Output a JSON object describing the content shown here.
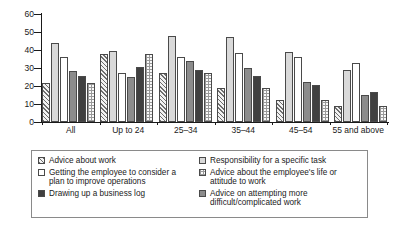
{
  "chart_data": {
    "type": "bar",
    "title": "",
    "xlabel": "",
    "ylabel": "",
    "ylim": [
      0,
      60
    ],
    "yticks": [
      0,
      10,
      20,
      30,
      40,
      50,
      60
    ],
    "grid": false,
    "legend_position": "bottom",
    "categories": [
      "All",
      "Up to 24",
      "25–34",
      "35–44",
      "45–54",
      "55 and above"
    ],
    "series": [
      {
        "name": "Advice about work",
        "pattern": "diagonal-hatch",
        "color": "#f2f2f2",
        "values": [
          21.5,
          38.0,
          27.5,
          19.0,
          12.0,
          9.0
        ]
      },
      {
        "name": "Responsibility for a specific task",
        "pattern": "light-gray-solid",
        "color": "#d9d9d9",
        "values": [
          44.0,
          39.5,
          48.0,
          47.5,
          39.0,
          29.0
        ]
      },
      {
        "name": "Getting the employee to consider a plan to improve operations",
        "pattern": "white-empty",
        "color": "#ffffff",
        "values": [
          36.0,
          27.0,
          36.0,
          38.5,
          36.0,
          33.0
        ]
      },
      {
        "name": "Advice about the employee's life or attitude to work",
        "pattern": "medium-gray-solid",
        "color": "#8c8c8c",
        "values": [
          28.5,
          25.0,
          34.0,
          30.0,
          22.0,
          15.0
        ]
      },
      {
        "name": "Drawing up a business log",
        "pattern": "dark-gray-solid",
        "color": "#404040",
        "values": [
          25.5,
          30.5,
          29.0,
          25.5,
          20.5,
          16.5
        ]
      },
      {
        "name": "Advice on attempting more difficult/complicated work",
        "pattern": "light-checker",
        "color": "#fafafa",
        "values": [
          21.5,
          38.0,
          27.5,
          19.0,
          12.0,
          9.0
        ]
      }
    ]
  },
  "legend": {
    "items": [
      {
        "label": "Advice about work",
        "swatch": "diagonal-hatch"
      },
      {
        "label": "Getting the employee to consider a plan to improve operations",
        "swatch": "white-empty"
      },
      {
        "label": "Drawing up a business log",
        "swatch": "dark-gray-solid"
      },
      {
        "label": "Responsibility for a specific task",
        "swatch": "light-gray-solid"
      },
      {
        "label": "Advice about the employee's life or attitude to work",
        "swatch": "medium-gray-checker"
      },
      {
        "label": "Advice on attempting more difficult/complicated work",
        "swatch": "medium-gray-solid"
      }
    ]
  }
}
